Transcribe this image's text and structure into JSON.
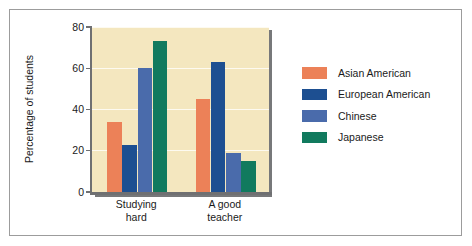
{
  "chart_data": {
    "type": "bar",
    "title": "",
    "xlabel": "",
    "ylabel": "Percentage of students",
    "ylim": [
      0,
      80
    ],
    "yticks": [
      0,
      20,
      40,
      60,
      80
    ],
    "ytick_labels": [
      "0",
      "20",
      "40",
      "60",
      "80"
    ],
    "grid": true,
    "legend_position": "right",
    "categories": [
      "Studying hard",
      "A good teacher"
    ],
    "category_lines": [
      [
        "Studying",
        "hard"
      ],
      [
        "A good",
        "teacher"
      ]
    ],
    "series": [
      {
        "name": "Asian American",
        "color": "#ec8158",
        "values": [
          34,
          45
        ]
      },
      {
        "name": "European American",
        "color": "#1d4f91",
        "values": [
          23,
          63
        ]
      },
      {
        "name": "Chinese",
        "color": "#4a6bab",
        "values": [
          60,
          19
        ]
      },
      {
        "name": "Japanese",
        "color": "#117a5e",
        "values": [
          73,
          15
        ]
      }
    ]
  },
  "plot": {
    "background_color": "#f4e7bf",
    "gridline_color": "#fdfaf0",
    "axis_color": "#6f7072",
    "shadow_color": "#77787a"
  },
  "figure": {
    "border_color": "#9c9c9c",
    "background_color": "#ffffff"
  }
}
